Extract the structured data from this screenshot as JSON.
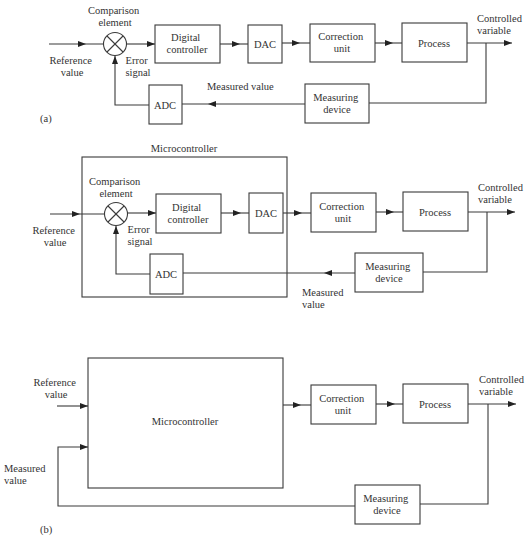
{
  "diagram_a": {
    "label": "(a)",
    "reference_value": [
      "Reference",
      "value"
    ],
    "comparison_element": [
      "Comparison",
      "element"
    ],
    "error_signal": [
      "Error",
      "signal"
    ],
    "digital_controller": [
      "Digital",
      "controller"
    ],
    "dac": "DAC",
    "correction_unit": [
      "Correction",
      "unit"
    ],
    "process": "Process",
    "controlled_variable": [
      "Controlled",
      "variable"
    ],
    "measured_value": "Measured value",
    "adc": "ADC",
    "measuring_device": [
      "Measuring",
      "device"
    ]
  },
  "diagram_mc": {
    "microcontroller": "Microcontroller",
    "reference_value": [
      "Reference",
      "value"
    ],
    "comparison_element": [
      "Comparison",
      "element"
    ],
    "error_signal": [
      "Error",
      "signal"
    ],
    "digital_controller": [
      "Digital",
      "controller"
    ],
    "dac": "DAC",
    "correction_unit": [
      "Correction",
      "unit"
    ],
    "process": "Process",
    "controlled_variable": [
      "Controlled",
      "variable"
    ],
    "adc": "ADC",
    "measuring_device": [
      "Measuring",
      "device"
    ],
    "measured_value": [
      "Measured",
      "value"
    ]
  },
  "diagram_b": {
    "label": "(b)",
    "reference_value": [
      "Reference",
      "value"
    ],
    "microcontroller": "Microcontroller",
    "correction_unit": [
      "Correction",
      "unit"
    ],
    "process": "Process",
    "controlled_variable": [
      "Controlled",
      "variable"
    ],
    "measured_value": [
      "Measured",
      "value"
    ],
    "measuring_device": [
      "Measuring",
      "device"
    ]
  }
}
